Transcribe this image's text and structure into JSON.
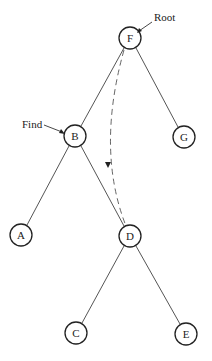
{
  "diagram": {
    "type": "binary-tree",
    "nodes": [
      {
        "id": "F",
        "label": "F",
        "x": 130,
        "y": 38
      },
      {
        "id": "B",
        "label": "B",
        "x": 75,
        "y": 136
      },
      {
        "id": "G",
        "label": "G",
        "x": 184,
        "y": 137
      },
      {
        "id": "A",
        "label": "A",
        "x": 21,
        "y": 235
      },
      {
        "id": "D",
        "label": "D",
        "x": 130,
        "y": 236
      },
      {
        "id": "C",
        "label": "C",
        "x": 76,
        "y": 333
      },
      {
        "id": "E",
        "label": "E",
        "x": 186,
        "y": 334
      }
    ],
    "edges": [
      {
        "from": "F",
        "to": "B"
      },
      {
        "from": "F",
        "to": "G"
      },
      {
        "from": "B",
        "to": "A"
      },
      {
        "from": "B",
        "to": "D"
      },
      {
        "from": "D",
        "to": "C"
      },
      {
        "from": "D",
        "to": "E"
      }
    ],
    "annotations": {
      "root": {
        "label": "Root",
        "points_to": "F"
      },
      "find": {
        "label": "Find",
        "points_to": "B"
      }
    },
    "dashed_arrow": {
      "from": "F",
      "to": "D",
      "style": "dashed",
      "direction": "downward"
    }
  }
}
